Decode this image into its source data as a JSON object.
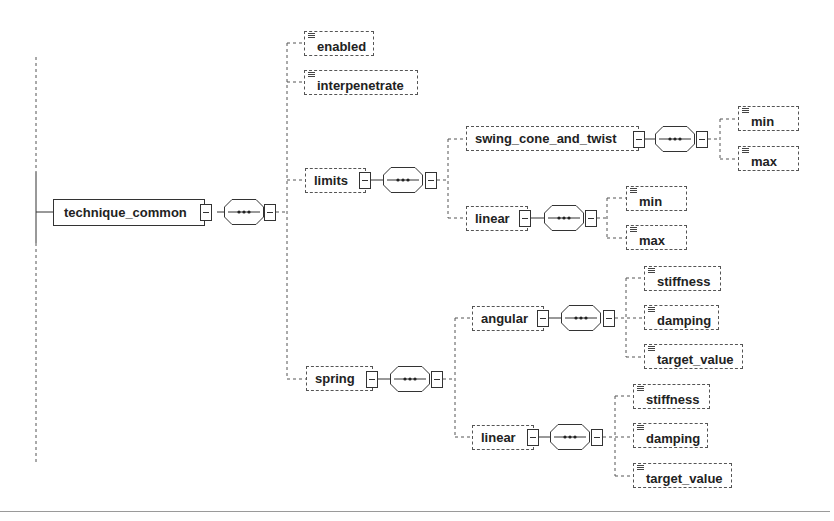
{
  "diagram": {
    "type": "xml-schema-tree",
    "root": {
      "label": "technique_common",
      "compositor": "sequence",
      "children": [
        {
          "label": "enabled",
          "kind": "leaf"
        },
        {
          "label": "interpenetrate",
          "kind": "leaf"
        },
        {
          "label": "limits",
          "compositor": "sequence",
          "children": [
            {
              "label": "swing_cone_and_twist",
              "compositor": "sequence",
              "children": [
                {
                  "label": "min",
                  "kind": "leaf"
                },
                {
                  "label": "max",
                  "kind": "leaf"
                }
              ]
            },
            {
              "label": "linear",
              "compositor": "sequence",
              "children": [
                {
                  "label": "min",
                  "kind": "leaf"
                },
                {
                  "label": "max",
                  "kind": "leaf"
                }
              ]
            }
          ]
        },
        {
          "label": "spring",
          "compositor": "sequence",
          "children": [
            {
              "label": "angular",
              "compositor": "sequence",
              "children": [
                {
                  "label": "stiffness",
                  "kind": "leaf"
                },
                {
                  "label": "damping",
                  "kind": "leaf"
                },
                {
                  "label": "target_value",
                  "kind": "leaf"
                }
              ]
            },
            {
              "label": "linear",
              "compositor": "sequence",
              "children": [
                {
                  "label": "stiffness",
                  "kind": "leaf"
                },
                {
                  "label": "damping",
                  "kind": "leaf"
                },
                {
                  "label": "target_value",
                  "kind": "leaf"
                }
              ]
            }
          ]
        }
      ]
    },
    "colors": {
      "line": "#333333",
      "dashed": "#555555",
      "background": "#ffffff",
      "rule": "#9a9a9a"
    }
  }
}
